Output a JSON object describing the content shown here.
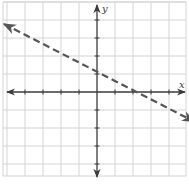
{
  "chart_data": {
    "type": "line",
    "title": "",
    "xlabel": "x",
    "ylabel": "y",
    "xlim": [
      -5,
      5
    ],
    "ylim": [
      -5,
      5
    ],
    "grid": true,
    "grid_step": 1,
    "series": [
      {
        "name": "boundary line y = -0.5x + 1",
        "style": "dashed",
        "slope": -0.5,
        "intercept": 1,
        "x": [
          -5.5,
          0,
          2,
          5.5
        ],
        "y": [
          3.75,
          1,
          0,
          -1.75
        ],
        "arrows": "both"
      }
    ],
    "annotations": []
  },
  "labels": {
    "x_axis": "x",
    "y_axis": "y"
  },
  "colors": {
    "grid": "#d4d4d4",
    "axis": "#3a3a3a",
    "line": "#555555"
  }
}
